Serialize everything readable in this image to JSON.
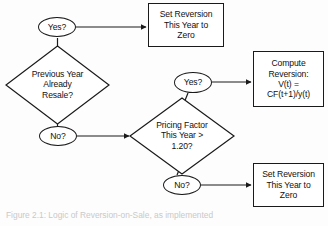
{
  "figure": {
    "caption": "Figure 2.1: Logic of Reversion-on-Sale, as implemented",
    "background_color": "#fdfdfd",
    "line_color": "#1a1a1a",
    "text_color": "#111111"
  },
  "nodes": {
    "decision_prev_resale": {
      "type": "diamond",
      "text": "Previous Year\nAlready\nResale?"
    },
    "decision_pricing_factor": {
      "type": "diamond",
      "text": "Pricing Factor\nThis Year >\n1.20?"
    },
    "branch_prev_yes": {
      "type": "ellipse",
      "text": "Yes?"
    },
    "branch_prev_no": {
      "type": "ellipse",
      "text": "No?"
    },
    "branch_pricing_yes": {
      "type": "ellipse",
      "text": "Yes?"
    },
    "branch_pricing_no": {
      "type": "ellipse",
      "text": "No?"
    },
    "process_zero_top": {
      "type": "rectangle",
      "text": "Set Reversion\nThis Year to\nZero"
    },
    "process_compute_reversion": {
      "type": "rectangle",
      "text": "Compute\nReversion:\nV(t) =\nCF(t+1)/y(t)"
    },
    "process_zero_bottom": {
      "type": "rectangle",
      "text": "Set Reversion\nThis Year to\nZero"
    }
  },
  "edges": [
    {
      "from": "decision_prev_resale",
      "to": "branch_prev_yes",
      "label": ""
    },
    {
      "from": "branch_prev_yes",
      "to": "process_zero_top",
      "label": ""
    },
    {
      "from": "decision_prev_resale",
      "to": "branch_prev_no",
      "label": ""
    },
    {
      "from": "branch_prev_no",
      "to": "decision_pricing_factor",
      "label": ""
    },
    {
      "from": "decision_pricing_factor",
      "to": "branch_pricing_yes",
      "label": ""
    },
    {
      "from": "branch_pricing_yes",
      "to": "process_compute_reversion",
      "label": ""
    },
    {
      "from": "decision_pricing_factor",
      "to": "branch_pricing_no",
      "label": ""
    },
    {
      "from": "branch_pricing_no",
      "to": "process_zero_bottom",
      "label": ""
    }
  ]
}
